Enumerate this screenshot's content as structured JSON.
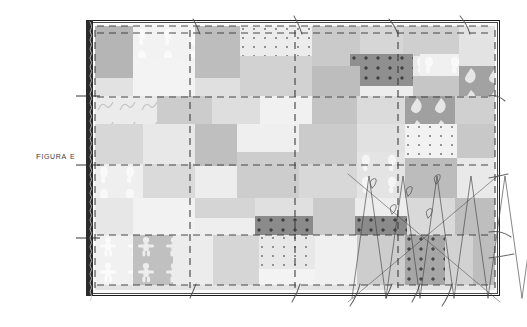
{
  "figure": {
    "caption": "Figura E",
    "caption_color": "#3c3c3c",
    "frame_color": "#1c1c1c",
    "spine_color": "#2a2a2a",
    "gridline_color": "#3a3a3a",
    "sketch_line_color": "#4a4a4a",
    "background": "#ffffff"
  },
  "canvas": {
    "x": 95,
    "y": 26,
    "width": 400,
    "height": 264,
    "base_color": "#ededed"
  },
  "palette": {
    "lightest": "#f4f4f4",
    "light": "#e6e6e6",
    "mid_light": "#dcdcdc",
    "mid": "#cfcfcf",
    "mid_dark": "#bdbdbd",
    "dark": "#a8a8a8",
    "darker": "#9a9a9a",
    "darkest": "#8d8d8d"
  },
  "grid": {
    "vertical_lines": [
      0,
      95,
      200,
      303,
      400
    ],
    "horizontal_lines": [
      0,
      7,
      71,
      139,
      209,
      259
    ],
    "style": "dashed"
  },
  "patches": [
    {
      "x": 0,
      "y": 0,
      "w": 38,
      "h": 52,
      "color": "#b5b5b5",
      "texture": "none"
    },
    {
      "x": 38,
      "y": 0,
      "w": 62,
      "h": 32,
      "color": "#f2f2f2",
      "texture": "paw"
    },
    {
      "x": 100,
      "y": 0,
      "w": 45,
      "h": 52,
      "color": "#bdbdbd",
      "texture": "none"
    },
    {
      "x": 145,
      "y": 0,
      "w": 72,
      "h": 30,
      "color": "#ececec",
      "texture": "dots-sparse"
    },
    {
      "x": 217,
      "y": 0,
      "w": 48,
      "h": 40,
      "color": "#cacaca",
      "texture": "none"
    },
    {
      "x": 265,
      "y": 0,
      "w": 43,
      "h": 28,
      "color": "#d6d6d6",
      "texture": "none"
    },
    {
      "x": 265,
      "y": 28,
      "w": 60,
      "h": 22,
      "color": "#e9e9e9",
      "texture": "paw"
    },
    {
      "x": 308,
      "y": 0,
      "w": 56,
      "h": 30,
      "color": "#cfcfcf",
      "texture": "none"
    },
    {
      "x": 364,
      "y": 0,
      "w": 36,
      "h": 40,
      "color": "#e3e3e3",
      "texture": "none"
    },
    {
      "x": 38,
      "y": 32,
      "w": 62,
      "h": 38,
      "color": "#f3f3f3",
      "texture": "none"
    },
    {
      "x": 145,
      "y": 30,
      "w": 72,
      "h": 40,
      "color": "#d2d2d2",
      "texture": "none"
    },
    {
      "x": 255,
      "y": 28,
      "w": 63,
      "h": 32,
      "color": "#8f8f8f",
      "texture": "dots-grid"
    },
    {
      "x": 325,
      "y": 28,
      "w": 39,
      "h": 22,
      "color": "#f0f0f0",
      "texture": "paw"
    },
    {
      "x": 364,
      "y": 40,
      "w": 36,
      "h": 30,
      "color": "#a2a2a2",
      "texture": "leaf"
    },
    {
      "x": 318,
      "y": 50,
      "w": 46,
      "h": 20,
      "color": "#c6c6c6",
      "texture": "none"
    },
    {
      "x": 0,
      "y": 52,
      "w": 38,
      "h": 38,
      "color": "#e2e2e2",
      "texture": "none"
    },
    {
      "x": 100,
      "y": 52,
      "w": 45,
      "h": 28,
      "color": "#e0e0e0",
      "texture": "none"
    },
    {
      "x": 217,
      "y": 40,
      "w": 48,
      "h": 30,
      "color": "#bdbdbd",
      "texture": "none"
    },
    {
      "x": 0,
      "y": 70,
      "w": 62,
      "h": 28,
      "color": "#ebebeb",
      "texture": "squiggle"
    },
    {
      "x": 62,
      "y": 70,
      "w": 55,
      "h": 28,
      "color": "#cccccc",
      "texture": "none"
    },
    {
      "x": 117,
      "y": 70,
      "w": 48,
      "h": 28,
      "color": "#dedede",
      "texture": "none"
    },
    {
      "x": 165,
      "y": 70,
      "w": 52,
      "h": 28,
      "color": "#f1f1f1",
      "texture": "none"
    },
    {
      "x": 217,
      "y": 70,
      "w": 45,
      "h": 28,
      "color": "#c4c4c4",
      "texture": "none"
    },
    {
      "x": 262,
      "y": 70,
      "w": 48,
      "h": 28,
      "color": "#dbdbdb",
      "texture": "none"
    },
    {
      "x": 310,
      "y": 70,
      "w": 50,
      "h": 28,
      "color": "#a0a0a0",
      "texture": "leaf"
    },
    {
      "x": 360,
      "y": 70,
      "w": 40,
      "h": 28,
      "color": "#d0d0d0",
      "texture": "none"
    },
    {
      "x": 0,
      "y": 98,
      "w": 48,
      "h": 40,
      "color": "#d7d7d7",
      "texture": "none"
    },
    {
      "x": 48,
      "y": 98,
      "w": 52,
      "h": 40,
      "color": "#e8e8e8",
      "texture": "none"
    },
    {
      "x": 100,
      "y": 98,
      "w": 42,
      "h": 42,
      "color": "#bfbfbf",
      "texture": "none"
    },
    {
      "x": 142,
      "y": 98,
      "w": 62,
      "h": 28,
      "color": "#efefef",
      "texture": "none"
    },
    {
      "x": 204,
      "y": 98,
      "w": 58,
      "h": 40,
      "color": "#cbcbcb",
      "texture": "none"
    },
    {
      "x": 262,
      "y": 98,
      "w": 48,
      "h": 28,
      "color": "#e1e1e1",
      "texture": "none"
    },
    {
      "x": 310,
      "y": 98,
      "w": 52,
      "h": 34,
      "color": "#f2f2f2",
      "texture": "dots-sparse"
    },
    {
      "x": 362,
      "y": 98,
      "w": 38,
      "h": 34,
      "color": "#c8c8c8",
      "texture": "none"
    },
    {
      "x": 0,
      "y": 138,
      "w": 48,
      "h": 34,
      "color": "#efefef",
      "texture": "paw"
    },
    {
      "x": 48,
      "y": 138,
      "w": 52,
      "h": 34,
      "color": "#dadada",
      "texture": "none"
    },
    {
      "x": 142,
      "y": 126,
      "w": 62,
      "h": 46,
      "color": "#cdcdcd",
      "texture": "none"
    },
    {
      "x": 262,
      "y": 126,
      "w": 48,
      "h": 46,
      "color": "#e4e4e4",
      "texture": "paw"
    },
    {
      "x": 310,
      "y": 132,
      "w": 52,
      "h": 40,
      "color": "#bcbcbc",
      "texture": "none"
    },
    {
      "x": 362,
      "y": 132,
      "w": 38,
      "h": 40,
      "color": "#e9e9e9",
      "texture": "none"
    },
    {
      "x": 204,
      "y": 138,
      "w": 58,
      "h": 34,
      "color": "#d8d8d8",
      "texture": "none"
    },
    {
      "x": 0,
      "y": 172,
      "w": 38,
      "h": 37,
      "color": "#e7e7e7",
      "texture": "none"
    },
    {
      "x": 38,
      "y": 172,
      "w": 62,
      "h": 37,
      "color": "#f2f2f2",
      "texture": "none"
    },
    {
      "x": 100,
      "y": 172,
      "w": 60,
      "h": 20,
      "color": "#d5d5d5",
      "texture": "none"
    },
    {
      "x": 160,
      "y": 190,
      "w": 58,
      "h": 19,
      "color": "#8b8b8b",
      "texture": "dots-grid"
    },
    {
      "x": 100,
      "y": 192,
      "w": 60,
      "h": 17,
      "color": "#eeeeee",
      "texture": "none"
    },
    {
      "x": 160,
      "y": 172,
      "w": 58,
      "h": 18,
      "color": "#e0e0e0",
      "texture": "none"
    },
    {
      "x": 218,
      "y": 172,
      "w": 42,
      "h": 37,
      "color": "#cacaca",
      "texture": "none"
    },
    {
      "x": 260,
      "y": 190,
      "w": 52,
      "h": 19,
      "color": "#8b8b8b",
      "texture": "dots-grid"
    },
    {
      "x": 260,
      "y": 172,
      "w": 52,
      "h": 18,
      "color": "#ededed",
      "texture": "none"
    },
    {
      "x": 312,
      "y": 172,
      "w": 48,
      "h": 37,
      "color": "#d9d9d9",
      "texture": "none"
    },
    {
      "x": 360,
      "y": 172,
      "w": 40,
      "h": 37,
      "color": "#bebebe",
      "texture": "none"
    },
    {
      "x": 0,
      "y": 209,
      "w": 38,
      "h": 50,
      "color": "#f1f1f1",
      "texture": "gingerbread"
    },
    {
      "x": 38,
      "y": 209,
      "w": 40,
      "h": 50,
      "color": "#c0c0c0",
      "texture": "gingerbread"
    },
    {
      "x": 78,
      "y": 209,
      "w": 40,
      "h": 50,
      "color": "#ececec",
      "texture": "none"
    },
    {
      "x": 118,
      "y": 209,
      "w": 46,
      "h": 50,
      "color": "#d6d6d6",
      "texture": "none"
    },
    {
      "x": 164,
      "y": 209,
      "w": 56,
      "h": 34,
      "color": "#e8e8e8",
      "texture": "dots-sparse"
    },
    {
      "x": 164,
      "y": 243,
      "w": 56,
      "h": 16,
      "color": "#f3f3f3",
      "texture": "none"
    },
    {
      "x": 220,
      "y": 209,
      "w": 42,
      "h": 50,
      "color": "#f0f0f0",
      "texture": "none"
    },
    {
      "x": 262,
      "y": 209,
      "w": 48,
      "h": 50,
      "color": "#cdcdcd",
      "texture": "none"
    },
    {
      "x": 310,
      "y": 209,
      "w": 40,
      "h": 50,
      "color": "#a6a6a6",
      "texture": "dots-grid"
    },
    {
      "x": 350,
      "y": 209,
      "w": 28,
      "h": 50,
      "color": "#d2d2d2",
      "texture": "none"
    },
    {
      "x": 378,
      "y": 209,
      "w": 22,
      "h": 50,
      "color": "#bdbdbd",
      "texture": "none"
    },
    {
      "x": 0,
      "y": 259,
      "w": 400,
      "h": 5,
      "color": "#e4e4e4",
      "texture": "none"
    }
  ],
  "annotations": {
    "top_tick_marks": 4,
    "bottom_tick_marks": 6,
    "right_tick_marks": 4,
    "left_tick_marks": 3,
    "crosshatch_region": {
      "label": "zigzag-overlay",
      "x": 352,
      "y": 176,
      "w": 146,
      "h": 122
    }
  }
}
